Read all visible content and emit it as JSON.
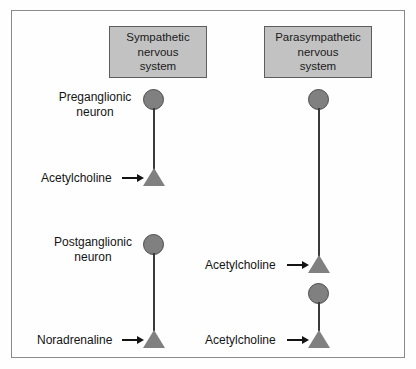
{
  "diagram": {
    "columns": [
      {
        "id": "sympathetic",
        "header_line1": "Sympathetic",
        "header_line2": "nervous",
        "header_line3": "system"
      },
      {
        "id": "parasympathetic",
        "header_line1": "Parasympathetic",
        "header_line2": "nervous",
        "header_line3": "system"
      }
    ],
    "neuron_labels": {
      "preganglionic_line1": "Preganglionic",
      "preganglionic_line2": "neuron",
      "postganglionic_line1": "Postganglionic",
      "postganglionic_line2": "neuron"
    },
    "transmitters": {
      "symp_preganglionic": "Acetylcholine",
      "symp_postganglionic": "Noradrenaline",
      "para_preganglionic": "Acetylcholine",
      "para_postganglionic": "Acetylcholine"
    },
    "colors": {
      "soma_fill": "#808080",
      "soma_stroke": "#4a4a4a",
      "terminal_fill": "#808080",
      "axon": "#3a3a3a",
      "header_box_fill": "#c2c2c2",
      "header_box_stroke": "#5d5d5d",
      "frame_stroke": "#8a8a8a",
      "text": "#141414",
      "background": "#fefefe"
    }
  }
}
